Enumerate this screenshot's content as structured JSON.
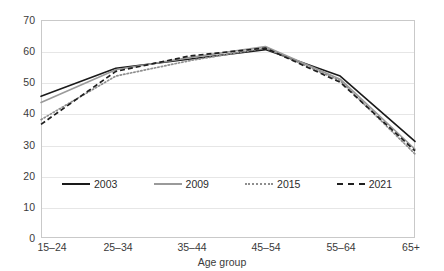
{
  "title_fragment": "",
  "axis": {
    "y_ticks": [
      "0",
      "10",
      "20",
      "30",
      "40",
      "50",
      "60",
      "70"
    ],
    "x_title": "Age group"
  },
  "legend": [
    {
      "label": "2003",
      "style": "solid",
      "color": "#1a1a1a",
      "swatch": "sw-solid-black"
    },
    {
      "label": "2009",
      "style": "solid",
      "color": "#9a9a9a",
      "swatch": "sw-solid-gray"
    },
    {
      "label": "2015",
      "style": "dotted",
      "color": "#8e8e8e",
      "swatch": "sw-dotted"
    },
    {
      "label": "2021",
      "style": "dashed",
      "color": "#1f1f1f",
      "swatch": "sw-dashed"
    }
  ],
  "chart_data": {
    "type": "line",
    "title": "",
    "xlabel": "Age group",
    "ylabel": "",
    "ylim": [
      0,
      70
    ],
    "ytick_step": 10,
    "grid": true,
    "legend_position": "bottom-inside",
    "categories": [
      "15–24",
      "25–34",
      "35–44",
      "45–54",
      "55–64",
      "65+"
    ],
    "series": [
      {
        "name": "2003",
        "values": [
          45.5,
          54.5,
          57.5,
          60.5,
          52.0,
          31.0
        ]
      },
      {
        "name": "2009",
        "values": [
          43.5,
          54.0,
          58.0,
          61.5,
          51.0,
          28.5
        ]
      },
      {
        "name": "2015",
        "values": [
          38.0,
          52.0,
          57.0,
          61.0,
          50.5,
          27.0
        ]
      },
      {
        "name": "2021",
        "values": [
          36.5,
          53.5,
          58.5,
          61.0,
          50.0,
          28.0
        ]
      }
    ]
  }
}
